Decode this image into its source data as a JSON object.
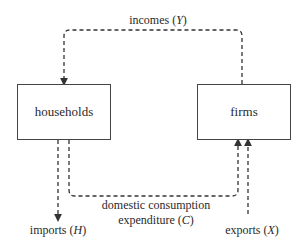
{
  "diagram": {
    "nodes": [
      {
        "id": "households",
        "label": "households"
      },
      {
        "id": "firms",
        "label": "firms"
      }
    ],
    "flows": [
      {
        "id": "incomes",
        "label": "incomes",
        "symbol": "Y",
        "from": "firms",
        "to": "households"
      },
      {
        "id": "consumption",
        "label_line1": "domestic consumption",
        "label_line2": "expenditure",
        "symbol": "C",
        "from": "households",
        "to": "firms"
      },
      {
        "id": "imports",
        "label": "imports",
        "symbol": "H",
        "from": "households",
        "to": "outside"
      },
      {
        "id": "exports",
        "label": "exports",
        "symbol": "X",
        "from": "outside",
        "to": "firms"
      }
    ],
    "colors": {
      "line": "#333333",
      "box_border": "#444444",
      "background": "#ffffff"
    }
  }
}
